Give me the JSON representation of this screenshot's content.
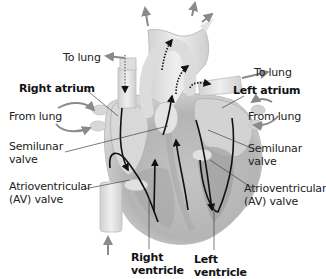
{
  "diagram": {
    "colors": {
      "heart_light": "#e6e6e6",
      "heart_mid": "#cfcfcf",
      "heart_dark": "#9c9c9c",
      "flow_arrow": "#111111",
      "vessel_arrow": "#8a8a8a",
      "leader_line": "#444444"
    },
    "labels": {
      "to_lung_left": "To lung",
      "to_lung_right": "To lung",
      "right_atrium": "Right atrium",
      "left_atrium": "Left atrium",
      "from_lung_left": "From  lung",
      "from_lung_right": "From lung",
      "semilunar_left_1": "Semilunar",
      "semilunar_left_2": "valve",
      "semilunar_right_1": "Semilunar",
      "semilunar_right_2": "valve",
      "av_left_1": "Atrioventricular",
      "av_left_2": "(AV) valve",
      "av_right_1": "Atrioventricular",
      "av_right_2": "(AV) valve",
      "right_ventricle_1": "Right",
      "right_ventricle_2": "ventricle",
      "left_ventricle_1": "Left",
      "left_ventricle_2": "ventricle"
    }
  }
}
